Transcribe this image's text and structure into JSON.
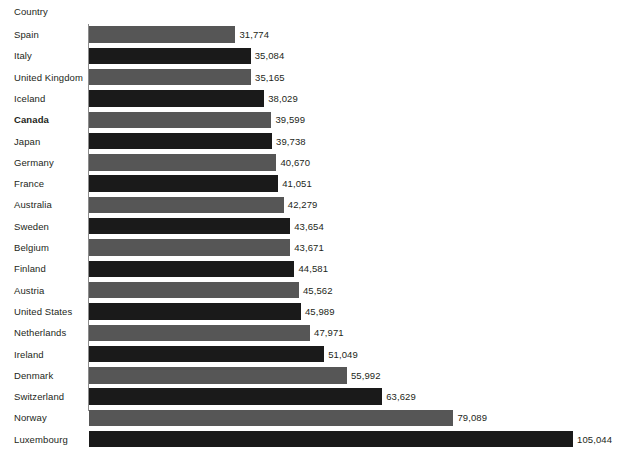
{
  "chart_data": {
    "type": "bar",
    "orientation": "horizontal",
    "title": "",
    "subtitle": "",
    "xlabel": "",
    "ylabel": "Country",
    "axis_header": "Country",
    "grid": false,
    "legend": null,
    "xlim": [
      0,
      105044
    ],
    "value_format": "comma-separated integer",
    "highlighted_category": "Canada",
    "bar_colors": {
      "dark": "#1a1a1a",
      "medium": "#565656"
    },
    "categories": [
      "Spain",
      "Italy",
      "United Kingdom",
      "Iceland",
      "Canada",
      "Japan",
      "Germany",
      "France",
      "Australia",
      "Sweden",
      "Belgium",
      "Finland",
      "Austria",
      "United States",
      "Netherlands",
      "Ireland",
      "Denmark",
      "Switzerland",
      "Norway",
      "Luxembourg"
    ],
    "values": [
      31774,
      35084,
      35165,
      38029,
      39599,
      39738,
      40670,
      41051,
      42279,
      43654,
      43671,
      44581,
      45562,
      45989,
      47971,
      51049,
      55992,
      63629,
      79089,
      105044
    ],
    "value_labels": [
      "31,774",
      "35,084",
      "35,165",
      "38,029",
      "39,599",
      "39,738",
      "40,670",
      "41,051",
      "42,279",
      "43,654",
      "43,671",
      "44,581",
      "45,562",
      "45,989",
      "47,971",
      "51,049",
      "55,992",
      "63,629",
      "79,089",
      "105,044"
    ],
    "rows": [
      {
        "label": "Spain",
        "value": 31774,
        "value_label": "31,774",
        "shade": "medium",
        "bold": false
      },
      {
        "label": "Italy",
        "value": 35084,
        "value_label": "35,084",
        "shade": "dark",
        "bold": false
      },
      {
        "label": "United Kingdom",
        "value": 35165,
        "value_label": "35,165",
        "shade": "medium",
        "bold": false
      },
      {
        "label": "Iceland",
        "value": 38029,
        "value_label": "38,029",
        "shade": "dark",
        "bold": false
      },
      {
        "label": "Canada",
        "value": 39599,
        "value_label": "39,599",
        "shade": "medium",
        "bold": true
      },
      {
        "label": "Japan",
        "value": 39738,
        "value_label": "39,738",
        "shade": "dark",
        "bold": false
      },
      {
        "label": "Germany",
        "value": 40670,
        "value_label": "40,670",
        "shade": "medium",
        "bold": false
      },
      {
        "label": "France",
        "value": 41051,
        "value_label": "41,051",
        "shade": "dark",
        "bold": false
      },
      {
        "label": "Australia",
        "value": 42279,
        "value_label": "42,279",
        "shade": "medium",
        "bold": false
      },
      {
        "label": "Sweden",
        "value": 43654,
        "value_label": "43,654",
        "shade": "dark",
        "bold": false
      },
      {
        "label": "Belgium",
        "value": 43671,
        "value_label": "43,671",
        "shade": "medium",
        "bold": false
      },
      {
        "label": "Finland",
        "value": 44581,
        "value_label": "44,581",
        "shade": "dark",
        "bold": false
      },
      {
        "label": "Austria",
        "value": 45562,
        "value_label": "45,562",
        "shade": "medium",
        "bold": false
      },
      {
        "label": "United States",
        "value": 45989,
        "value_label": "45,989",
        "shade": "dark",
        "bold": false
      },
      {
        "label": "Netherlands",
        "value": 47971,
        "value_label": "47,971",
        "shade": "medium",
        "bold": false
      },
      {
        "label": "Ireland",
        "value": 51049,
        "value_label": "51,049",
        "shade": "dark",
        "bold": false
      },
      {
        "label": "Denmark",
        "value": 55992,
        "value_label": "55,992",
        "shade": "medium",
        "bold": false
      },
      {
        "label": "Switzerland",
        "value": 63629,
        "value_label": "63,629",
        "shade": "dark",
        "bold": false
      },
      {
        "label": "Norway",
        "value": 79089,
        "value_label": "79,089",
        "shade": "medium",
        "bold": false
      },
      {
        "label": "Luxembourg",
        "value": 105044,
        "value_label": "105,044",
        "shade": "dark",
        "bold": false
      }
    ]
  }
}
